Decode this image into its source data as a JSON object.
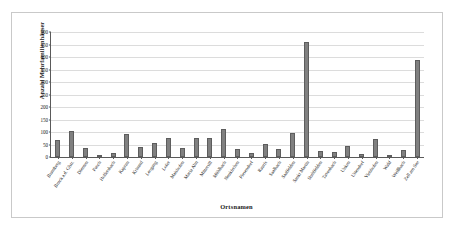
{
  "chart_data": {
    "type": "bar",
    "title": "",
    "xlabel": "Ortsnamen",
    "ylabel": "Anzahl Mehrfamilienhäuser",
    "ylim": [
      0,
      500
    ],
    "ytick_labels": [
      "500",
      "450",
      "400",
      "350",
      "300",
      "250",
      "200",
      "150",
      "100",
      "50",
      "0"
    ],
    "ytick_values": [
      500,
      450,
      400,
      350,
      300,
      250,
      200,
      150,
      100,
      50,
      0
    ],
    "grid": true,
    "legend": "none",
    "bar_color": "#808080",
    "bar_edge_color": "#5d5d5d",
    "categories": [
      "Bramberg",
      "Bruck a.d. Glstr.",
      "Dienten",
      "Fusch",
      "Hollersbach",
      "Kaprun",
      "Krimml",
      "Leogang",
      "Lofer",
      "Maishofen",
      "Maria Alm",
      "Mittersill",
      "Mühlbach",
      "Neukirchen",
      "Piesendorf",
      "Rauris",
      "Saalbach",
      "Saalfelden",
      "Sankt Martin",
      "Stuhlfelden",
      "Taxenbach",
      "Unken",
      "Uttendorf",
      "Viehhofen",
      "Wald",
      "Weißbach",
      "Zell am See"
    ],
    "values": [
      70,
      105,
      38,
      8,
      17,
      94,
      42,
      58,
      78,
      35,
      76,
      76,
      113,
      34,
      17,
      54,
      33,
      96,
      460,
      25,
      22,
      44,
      13,
      71,
      4,
      29,
      388
    ]
  }
}
